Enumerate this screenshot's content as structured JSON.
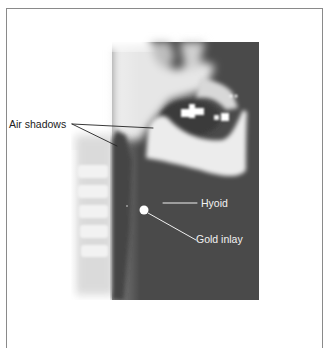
{
  "figure": {
    "type": "lateral neck radiograph",
    "labels": [
      {
        "id": "air-shadows",
        "text": "Air shadows"
      },
      {
        "id": "hyoid",
        "text": "Hyoid"
      },
      {
        "id": "gold-inlay",
        "text": "Gold inlay"
      }
    ]
  },
  "colors": {
    "frame": "#8a8a8a",
    "xray_dark": "#4a4a4a",
    "xray_light": "#f4f4f4",
    "label_dark": "#222222",
    "label_light": "#f2f2f2"
  }
}
